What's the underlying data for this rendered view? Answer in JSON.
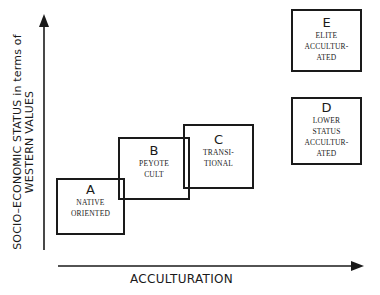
{
  "axes": {
    "y_label_line1": "SOCIO–ECONOMIC STATUS in terms of",
    "y_label_line2": "WESTERN VALUES",
    "x_label": "ACCULTURATION"
  },
  "boxes": [
    {
      "letter": "A",
      "lines": [
        "NATIVE",
        "ORIENTED"
      ]
    },
    {
      "letter": "B",
      "lines": [
        "PEYOTE",
        "CULT"
      ]
    },
    {
      "letter": "C",
      "lines": [
        "TRANSI-",
        "TIONAL"
      ]
    },
    {
      "letter": "D",
      "lines": [
        "LOWER",
        "STATUS",
        "ACCULTUR-",
        "ATED"
      ]
    },
    {
      "letter": "E",
      "lines": [
        "ELITE",
        "ACCULTUR-",
        "ATED"
      ]
    }
  ]
}
